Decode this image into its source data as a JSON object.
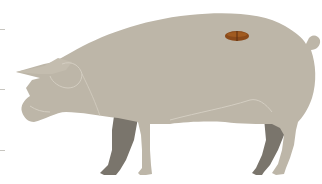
{
  "diagram": {
    "subject": "pig",
    "type": "meat-cut-diagram",
    "highlighted_cut": "loin",
    "colors": {
      "background": "#ffffff",
      "body": "#bdb6a8",
      "far_legs": "#7a756c",
      "outline_lines": "#d4cec2",
      "cut_marker": "#8a4a1a",
      "cut_marker_highlight": "#a65f22",
      "cut_marker_divider": "#5a2e10",
      "edge_ticks": "#c8c6c0"
    },
    "edge_ticks_y": [
      29,
      89,
      150
    ],
    "cut_marker": {
      "cx": 237,
      "cy": 36,
      "rx": 12,
      "ry": 5
    }
  }
}
